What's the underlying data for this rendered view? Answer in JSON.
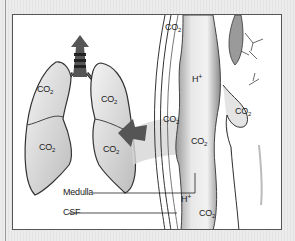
{
  "figure": {
    "caption_fragment": "",
    "labels": {
      "co2": "CO",
      "co2_sub": "2",
      "h": "H",
      "h_sup": "+"
    },
    "callouts": [
      {
        "id": "medulla",
        "label": "Medulla"
      },
      {
        "id": "csf",
        "label": "CSF"
      }
    ],
    "co2_markers": [
      {
        "location": "left-lung-upper",
        "text": "CO",
        "sub": "2"
      },
      {
        "location": "left-lung-lower",
        "text": "CO",
        "sub": "2"
      },
      {
        "location": "right-lung-upper",
        "text": "CO",
        "sub": "2"
      },
      {
        "location": "right-lung-lower",
        "text": "CO",
        "sub": "2"
      },
      {
        "location": "blood-vessel-top",
        "text": "CO",
        "sub": "2"
      },
      {
        "location": "blood-vessel-mid",
        "text": "CO",
        "sub": "2"
      },
      {
        "location": "brainstem-mid",
        "text": "CO",
        "sub": "2"
      },
      {
        "location": "brainstem-bottom",
        "text": "CO",
        "sub": "2"
      },
      {
        "location": "face-region",
        "text": "CO",
        "sub": "2"
      }
    ],
    "h_markers": [
      {
        "location": "brainstem-top",
        "text": "H",
        "sup": "+"
      },
      {
        "location": "csf-lower",
        "text": "H",
        "sup": "+"
      }
    ],
    "colors": {
      "background": "#e9e9e9",
      "panel": "#ffffff",
      "border": "#555555",
      "ink": "#222222",
      "arrow": "#555555"
    }
  }
}
